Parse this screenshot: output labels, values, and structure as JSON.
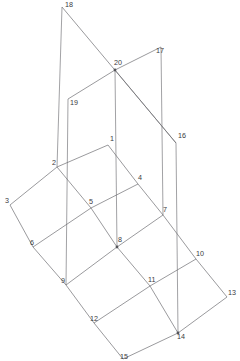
{
  "diagram": {
    "type": "wireframe-line-drawing",
    "canvas": {
      "width": 240,
      "height": 361
    },
    "style": {
      "background_color": "#ffffff",
      "line_color": "#6e6e72",
      "vertical_line_color": "#8a8a8e",
      "label_color": "#3a3a3e",
      "node_dot_color": "#55555a",
      "stroke_width": 0.7,
      "label_font_size": 7.2
    },
    "nodes": [
      {
        "id": "1",
        "label": "1",
        "x": 108,
        "y": 145,
        "lx": 110,
        "ly": 139,
        "dot": false
      },
      {
        "id": "2",
        "label": "2",
        "x": 57,
        "y": 167,
        "lx": 52,
        "ly": 163,
        "dot": false
      },
      {
        "id": "3",
        "label": "3",
        "x": 10,
        "y": 205,
        "lx": 5,
        "ly": 201,
        "dot": false
      },
      {
        "id": "4",
        "label": "4",
        "x": 138,
        "y": 184,
        "lx": 138,
        "ly": 178,
        "dot": false
      },
      {
        "id": "5",
        "label": "5",
        "x": 91,
        "y": 208,
        "lx": 89,
        "ly": 202,
        "dot": false
      },
      {
        "id": "6",
        "label": "6",
        "x": 33,
        "y": 247,
        "lx": 30,
        "ly": 243,
        "dot": false
      },
      {
        "id": "7",
        "label": "7",
        "x": 163,
        "y": 215,
        "lx": 163,
        "ly": 210,
        "dot": false
      },
      {
        "id": "8",
        "label": "8",
        "x": 117,
        "y": 247,
        "lx": 118,
        "ly": 240,
        "dot": true
      },
      {
        "id": "9",
        "label": "9",
        "x": 66,
        "y": 285,
        "lx": 61,
        "ly": 281,
        "dot": false
      },
      {
        "id": "10",
        "label": "10",
        "x": 196,
        "y": 259,
        "lx": 196,
        "ly": 254,
        "dot": false
      },
      {
        "id": "11",
        "label": "11",
        "x": 150,
        "y": 286,
        "lx": 148,
        "ly": 280,
        "dot": false
      },
      {
        "id": "12",
        "label": "12",
        "x": 94,
        "y": 323,
        "lx": 90,
        "ly": 319,
        "dot": false
      },
      {
        "id": "13",
        "label": "13",
        "x": 227,
        "y": 297,
        "lx": 228,
        "ly": 293,
        "dot": false
      },
      {
        "id": "14",
        "label": "14",
        "x": 178,
        "y": 333,
        "lx": 177,
        "ly": 337,
        "dot": true
      },
      {
        "id": "15",
        "label": "15",
        "x": 123,
        "y": 359,
        "lx": 120,
        "ly": 357,
        "dot": false
      },
      {
        "id": "16",
        "label": "16",
        "x": 176,
        "y": 143,
        "lx": 178,
        "ly": 136,
        "dot": false
      },
      {
        "id": "17",
        "label": "17",
        "x": 161,
        "y": 47,
        "lx": 156,
        "ly": 51,
        "dot": false
      },
      {
        "id": "18",
        "label": "18",
        "x": 62,
        "y": 7,
        "lx": 65,
        "ly": 5,
        "dot": false
      },
      {
        "id": "19",
        "label": "19",
        "x": 68,
        "y": 99,
        "lx": 70,
        "ly": 103,
        "dot": false
      },
      {
        "id": "20",
        "label": "20",
        "x": 115,
        "y": 70,
        "lx": 114,
        "ly": 63,
        "dot": true
      }
    ],
    "base_grid_edges": [
      {
        "from": "1",
        "to": "2",
        "kind": "grid"
      },
      {
        "from": "2",
        "to": "3",
        "kind": "grid"
      },
      {
        "from": "1",
        "to": "4",
        "kind": "grid"
      },
      {
        "from": "4",
        "to": "7",
        "kind": "grid"
      },
      {
        "from": "2",
        "to": "5",
        "kind": "grid"
      },
      {
        "from": "5",
        "to": "4",
        "kind": "grid"
      },
      {
        "from": "3",
        "to": "6",
        "kind": "grid"
      },
      {
        "from": "6",
        "to": "5",
        "kind": "grid"
      },
      {
        "from": "5",
        "to": "8",
        "kind": "grid"
      },
      {
        "from": "8",
        "to": "7",
        "kind": "grid"
      },
      {
        "from": "7",
        "to": "10",
        "kind": "grid"
      },
      {
        "from": "6",
        "to": "9",
        "kind": "grid"
      },
      {
        "from": "9",
        "to": "8",
        "kind": "grid"
      },
      {
        "from": "8",
        "to": "11",
        "kind": "grid"
      },
      {
        "from": "11",
        "to": "10",
        "kind": "grid"
      },
      {
        "from": "10",
        "to": "13",
        "kind": "grid"
      },
      {
        "from": "9",
        "to": "12",
        "kind": "grid"
      },
      {
        "from": "12",
        "to": "11",
        "kind": "grid"
      },
      {
        "from": "11",
        "to": "14",
        "kind": "grid"
      },
      {
        "from": "14",
        "to": "13",
        "kind": "grid"
      },
      {
        "from": "12",
        "to": "15",
        "kind": "grid"
      },
      {
        "from": "15",
        "to": "14",
        "kind": "grid"
      }
    ],
    "upper_plane_edges": [
      {
        "from": "18",
        "to": "16",
        "kind": "diagonal"
      },
      {
        "from": "19",
        "to": "20",
        "kind": "diagonal"
      },
      {
        "from": "20",
        "to": "17",
        "kind": "diagonal"
      },
      {
        "from": "20",
        "to": "16",
        "kind": "diagonal"
      }
    ],
    "vertical_edges": [
      {
        "from": "18",
        "to": "2",
        "kind": "vertical"
      },
      {
        "from": "19",
        "to": "9",
        "kind": "vertical"
      },
      {
        "from": "20",
        "to": "8",
        "kind": "vertical"
      },
      {
        "from": "17",
        "to": "7",
        "kind": "vertical"
      },
      {
        "from": "16",
        "to": "14",
        "kind": "vertical"
      }
    ]
  }
}
